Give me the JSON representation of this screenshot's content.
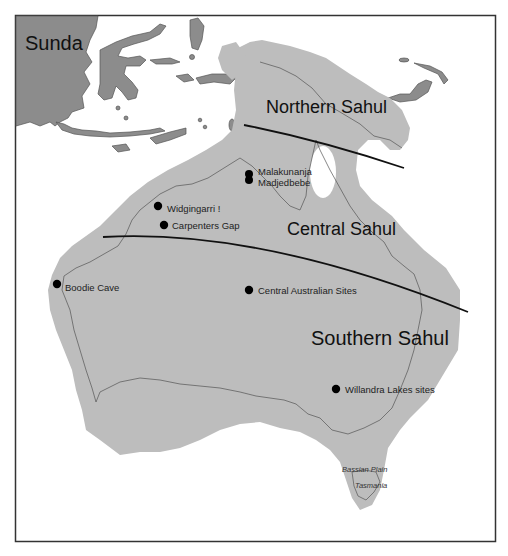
{
  "map": {
    "colors": {
      "sunda_land": "#8c8c8c",
      "sahul_land": "#bdbdbd",
      "coastline": "#555555",
      "boundary_line": "#111111",
      "site_marker": "#000000",
      "frame": "#333333",
      "sea": "#ffffff"
    },
    "regions": {
      "sunda": "Sunda",
      "northern_sahul": "Northern Sahul",
      "central_sahul": "Central Sahul",
      "southern_sahul": "Southern Sahul"
    },
    "sites": [
      {
        "name": "Malakunanja",
        "x": 249,
        "y": 174
      },
      {
        "name": "Madjedbebe",
        "x": 249,
        "y": 181
      },
      {
        "name": "Widgingarri !",
        "x": 158,
        "y": 206
      },
      {
        "name": "Carpenters Gap",
        "x": 164,
        "y": 225
      },
      {
        "name": "Boodie Cave",
        "x": 57,
        "y": 284
      },
      {
        "name": "Central Australian Sites",
        "x": 249,
        "y": 290
      },
      {
        "name": "Willandra Lakes sites",
        "x": 336,
        "y": 389
      }
    ],
    "minor_labels": {
      "bassian_plain": "Bassian Plain",
      "tasmania": "Tasmania"
    },
    "boundaries": [
      {
        "name": "northern-central-boundary"
      },
      {
        "name": "central-southern-boundary"
      }
    ]
  }
}
